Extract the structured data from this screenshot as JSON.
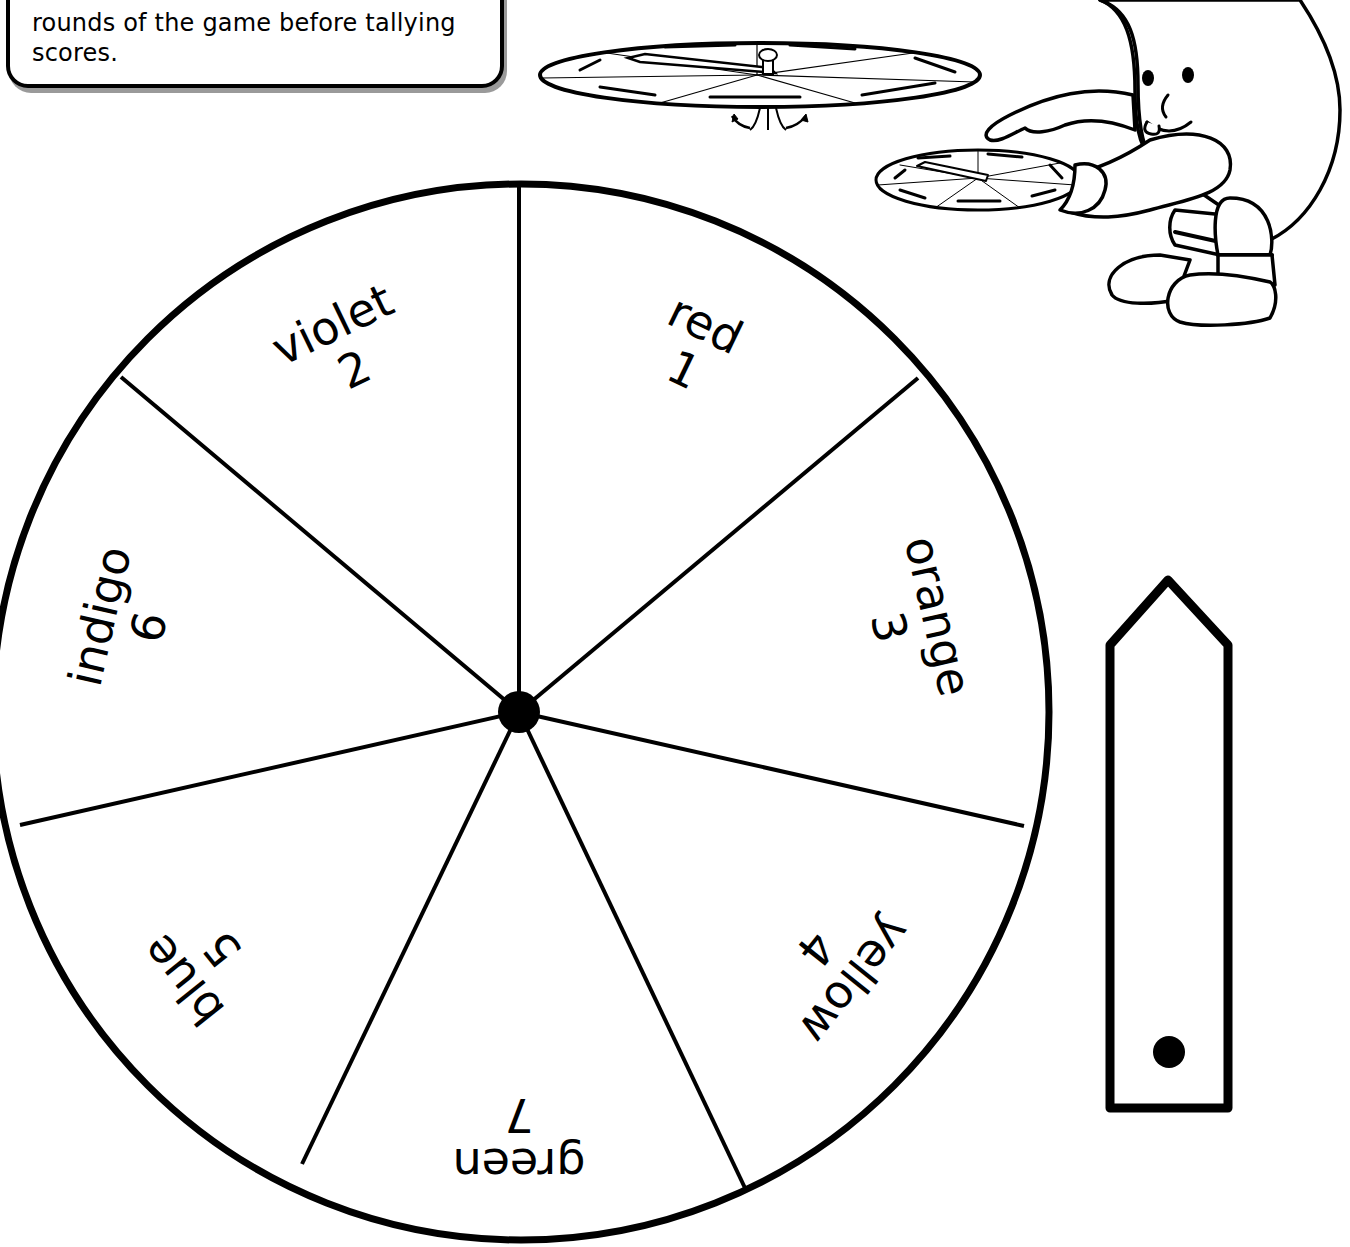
{
  "instructions": {
    "lines": [
      "player might decide to play",
      "rounds of the game before tallying",
      "scores."
    ]
  },
  "illustrations": {
    "spinner_diagram": "assembled spinner with pointer and brad fastener, side view",
    "mascot": "cartoon mascot character holding a spinner and pointing at it"
  },
  "wheel": {
    "sector_count": 7,
    "sectors": [
      {
        "color": "red",
        "number": "1",
        "angle": 25.7
      },
      {
        "color": "orange",
        "number": "3",
        "angle": 77.1
      },
      {
        "color": "yellow",
        "number": "4",
        "angle": 128.6
      },
      {
        "color": "green",
        "number": "7",
        "angle": 180
      },
      {
        "color": "blue",
        "number": "5",
        "angle": 231.4
      },
      {
        "color": "indigo",
        "number": "6",
        "angle": 282.9
      },
      {
        "color": "violet",
        "number": "2",
        "angle": 334.3
      }
    ]
  },
  "pointer": {
    "description": "cut-out spinner arrow with hole"
  },
  "colors": {
    "ink": "#000000",
    "paper": "#ffffff",
    "shadow": "#9a9a9a"
  }
}
